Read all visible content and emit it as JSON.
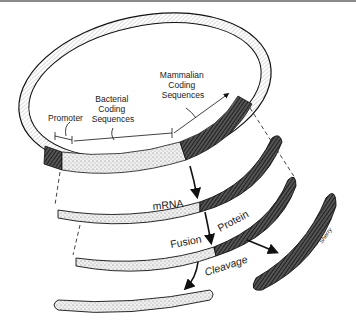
{
  "diagram": {
    "plasmid_labels": {
      "promoter": "Promoter",
      "bacterial": [
        "Bacterial",
        "Coding",
        "Sequences"
      ],
      "mammalian": [
        "Mammalian",
        "Coding",
        "Sequences"
      ]
    },
    "process_labels": {
      "mrna": "mRNA",
      "fusion": "Fusion",
      "protein": "Protein",
      "cleavage": "Cleavage"
    },
    "signature": "Sherry",
    "colors": {
      "ink": "#1a1a1a",
      "stipple": "#d8d8d8",
      "dark_segment": "#3a3a3a",
      "background": "#ffffff"
    }
  }
}
